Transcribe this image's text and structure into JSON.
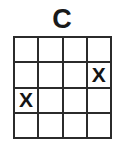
{
  "figure": {
    "title": "C",
    "background_color": "#ffffff",
    "line_color": "#2b2b2b",
    "mark_color": "#141414",
    "mark_symbol": "X"
  },
  "grid": {
    "rows": 4,
    "columns": 4,
    "cells": [
      [
        {
          "row": 1,
          "col": 1,
          "mark": ""
        },
        {
          "row": 1,
          "col": 2,
          "mark": ""
        },
        {
          "row": 1,
          "col": 3,
          "mark": ""
        },
        {
          "row": 1,
          "col": 4,
          "mark": ""
        }
      ],
      [
        {
          "row": 2,
          "col": 1,
          "mark": ""
        },
        {
          "row": 2,
          "col": 2,
          "mark": ""
        },
        {
          "row": 2,
          "col": 3,
          "mark": ""
        },
        {
          "row": 2,
          "col": 4,
          "mark": "X"
        }
      ],
      [
        {
          "row": 3,
          "col": 1,
          "mark": "X"
        },
        {
          "row": 3,
          "col": 2,
          "mark": ""
        },
        {
          "row": 3,
          "col": 3,
          "mark": ""
        },
        {
          "row": 3,
          "col": 4,
          "mark": ""
        }
      ],
      [
        {
          "row": 4,
          "col": 1,
          "mark": ""
        },
        {
          "row": 4,
          "col": 2,
          "mark": ""
        },
        {
          "row": 4,
          "col": 3,
          "mark": ""
        },
        {
          "row": 4,
          "col": 4,
          "mark": ""
        }
      ]
    ]
  }
}
